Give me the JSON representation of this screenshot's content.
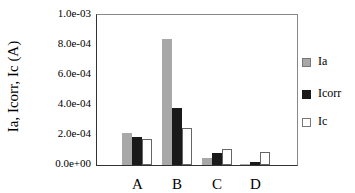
{
  "chart_data": {
    "type": "bar",
    "title": "",
    "xlabel": "",
    "ylabel": "I_a, I_corr, I_c (A)",
    "ylim": [
      0,
      0.001
    ],
    "yticks": [
      "0.0e+00",
      "2.0e-04",
      "4.0e-04",
      "6.0e-04",
      "8.0e-04",
      "1.0e-03"
    ],
    "categories": [
      "A",
      "B",
      "C",
      "D"
    ],
    "series": [
      {
        "name": "I_a",
        "color": "#a8a8a8",
        "values": [
          0.000215,
          0.00084,
          5e-05,
          1e-05
        ]
      },
      {
        "name": "I_corr",
        "color": "#1a1a1a",
        "values": [
          0.00019,
          0.00038,
          8e-05,
          2e-05
        ]
      },
      {
        "name": "I_c",
        "color": "#ffffff",
        "values": [
          0.000175,
          0.00025,
          0.00011,
          8.5e-05
        ]
      }
    ],
    "annotations": [
      "I_gal,A",
      "I_gal,B",
      "I_gal,C",
      "I_gal,D"
    ],
    "legend_position": "right"
  },
  "labels": {
    "ylabel": "Ia, Icorr, Ic (A)",
    "legend": [
      "Ia",
      "Icorr",
      "Ic"
    ]
  }
}
